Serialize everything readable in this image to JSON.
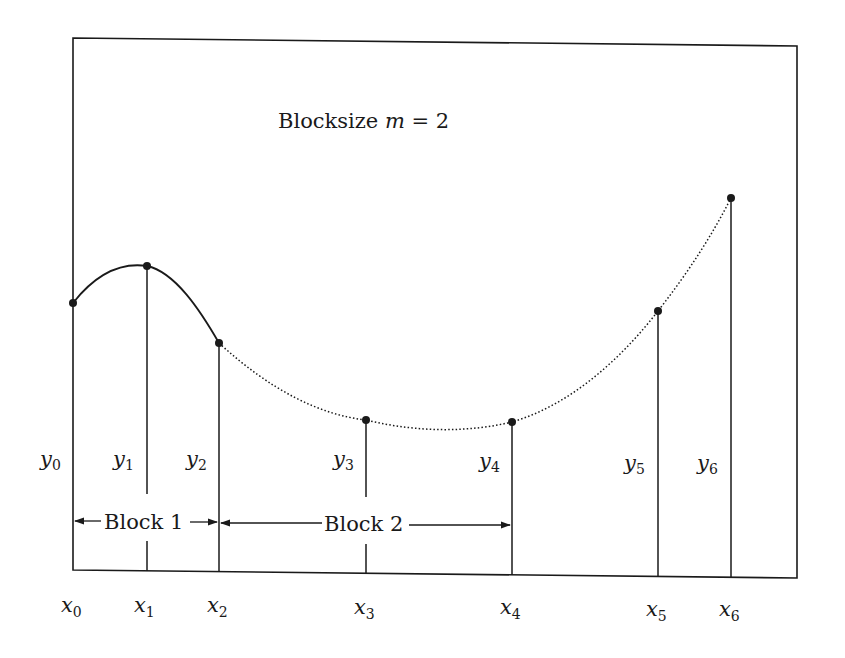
{
  "diagram": {
    "title": "Blocksize m = 2",
    "title_parts": {
      "text": "Blocksize ",
      "var": "m",
      "rest": " = 2"
    },
    "points": [
      {
        "x_label": "x",
        "x_sub": "0",
        "y_label": "y",
        "y_sub": "0",
        "px": 73,
        "py": 303
      },
      {
        "x_label": "x",
        "x_sub": "1",
        "y_label": "y",
        "y_sub": "1",
        "px": 147,
        "py": 266
      },
      {
        "x_label": "x",
        "x_sub": "2",
        "y_label": "y",
        "y_sub": "2",
        "px": 219,
        "py": 343
      },
      {
        "x_label": "x",
        "x_sub": "3",
        "y_label": "y",
        "y_sub": "3",
        "px": 366,
        "py": 420
      },
      {
        "x_label": "x",
        "x_sub": "4",
        "y_label": "y",
        "y_sub": "4",
        "px": 512,
        "py": 422
      },
      {
        "x_label": "x",
        "x_sub": "5",
        "y_label": "y",
        "y_sub": "5",
        "px": 658,
        "py": 311
      },
      {
        "x_label": "x",
        "x_sub": "6",
        "y_label": "y",
        "y_sub": "6",
        "px": 731,
        "py": 198
      }
    ],
    "blocks": [
      {
        "label": "Block 1",
        "from": "x0",
        "to": "x2"
      },
      {
        "label": "Block 2",
        "from": "x2",
        "to": "x4"
      }
    ],
    "curve_segments": [
      {
        "range": "x0-x2",
        "style": "solid"
      },
      {
        "range": "x2-x6",
        "style": "dotted"
      }
    ],
    "colors": {
      "ink": "#1a1a1a",
      "background": "#ffffff"
    }
  }
}
